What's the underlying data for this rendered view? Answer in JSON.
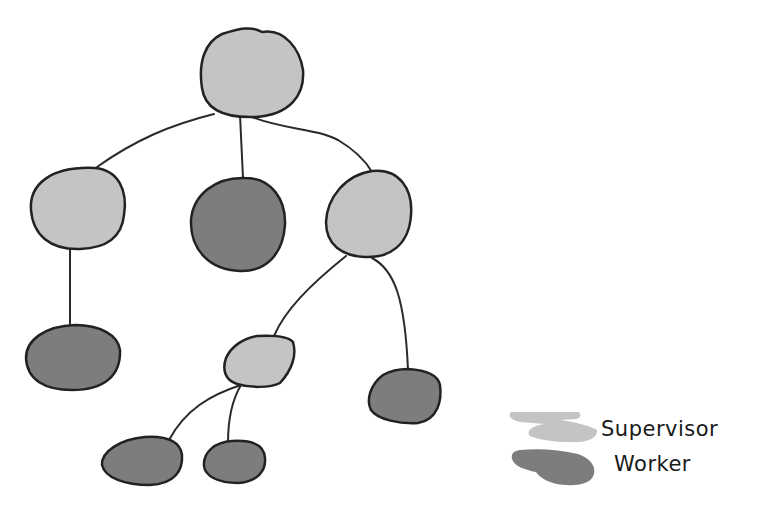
{
  "diagram": {
    "type": "hierarchy-tree",
    "colors": {
      "supervisor": "#c4c4c4",
      "worker": "#7d7d7d",
      "stroke": "#222222"
    },
    "nodes": [
      {
        "id": "root",
        "role": "supervisor"
      },
      {
        "id": "left-supervisor",
        "role": "supervisor"
      },
      {
        "id": "middle-worker",
        "role": "worker"
      },
      {
        "id": "right-supervisor",
        "role": "supervisor"
      },
      {
        "id": "left-worker",
        "role": "worker"
      },
      {
        "id": "sub-supervisor",
        "role": "supervisor"
      },
      {
        "id": "right-worker",
        "role": "worker"
      },
      {
        "id": "sub-worker-1",
        "role": "worker"
      },
      {
        "id": "sub-worker-2",
        "role": "worker"
      }
    ],
    "edges": [
      [
        "root",
        "left-supervisor"
      ],
      [
        "root",
        "middle-worker"
      ],
      [
        "root",
        "right-supervisor"
      ],
      [
        "left-supervisor",
        "left-worker"
      ],
      [
        "right-supervisor",
        "sub-supervisor"
      ],
      [
        "right-supervisor",
        "right-worker"
      ],
      [
        "sub-supervisor",
        "sub-worker-1"
      ],
      [
        "sub-supervisor",
        "sub-worker-2"
      ]
    ]
  },
  "legend": {
    "items": [
      {
        "label": "Supervisor",
        "role": "supervisor"
      },
      {
        "label": "Worker",
        "role": "worker"
      }
    ]
  }
}
